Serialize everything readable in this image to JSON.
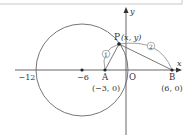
{
  "diagram": {
    "type": "coordinate-geometry",
    "axes": {
      "x_label": "x",
      "y_label": "y",
      "origin_label": "O"
    },
    "circle": {
      "center_value": -6,
      "center_label": "−6",
      "left_intercept_label": "−12",
      "radius": 6
    },
    "points": {
      "P": {
        "name": "P",
        "coords": "(x, y)"
      },
      "A": {
        "name": "A",
        "coords": "(−3, 0)"
      },
      "B": {
        "name": "B",
        "coords": "(6, 0)"
      }
    },
    "ratio_labels": {
      "PA": "1",
      "PB": "2"
    },
    "colors": {
      "line": "#555555",
      "text": "#333333",
      "point": "#222222",
      "border": "#bbbbbb"
    }
  }
}
